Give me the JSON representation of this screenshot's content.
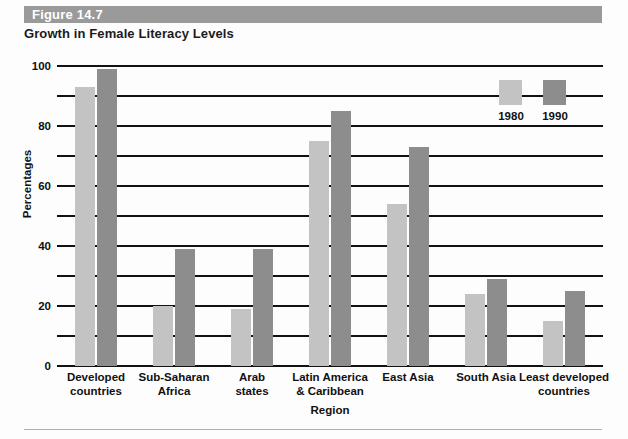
{
  "figure": {
    "band_label": "Figure 14.7",
    "title": "Growth in Female Literacy Levels",
    "band_color": "#9a9a9a"
  },
  "chart_data": {
    "type": "bar",
    "title": "Growth in Female Literacy Levels",
    "xlabel": "Region",
    "ylabel": "Percentages",
    "ylim": [
      0,
      100
    ],
    "yticks": [
      0,
      20,
      40,
      60,
      80,
      100
    ],
    "ytick_labels": [
      "0",
      "20",
      "40",
      "60",
      "80",
      "100"
    ],
    "minor_gridlines": [
      10,
      30,
      50,
      70,
      90
    ],
    "grid": true,
    "legend_position": "upper right inside",
    "categories": [
      "Developed countries",
      "Sub-Saharan Africa",
      "Arab states",
      "Latin America & Caribbean",
      "East Asia",
      "South Asia",
      "Least developed countries"
    ],
    "category_lines": [
      [
        "Developed",
        "countries"
      ],
      [
        "Sub-Saharan",
        "Africa"
      ],
      [
        "Arab",
        "states"
      ],
      [
        "Latin America",
        "& Caribbean"
      ],
      [
        "East Asia"
      ],
      [
        "South Asia"
      ],
      [
        "Least developed",
        "countries"
      ]
    ],
    "series": [
      {
        "name": "1980",
        "color": "#c3c3c3",
        "values": [
          93,
          20,
          19,
          75,
          54,
          24,
          15
        ]
      },
      {
        "name": "1990",
        "color": "#8d8d8d",
        "values": [
          99,
          39,
          39,
          85,
          73,
          29,
          25
        ]
      }
    ]
  },
  "legend": {
    "items": [
      {
        "label": "1980",
        "color": "#c3c3c3"
      },
      {
        "label": "1990",
        "color": "#8d8d8d"
      }
    ]
  }
}
